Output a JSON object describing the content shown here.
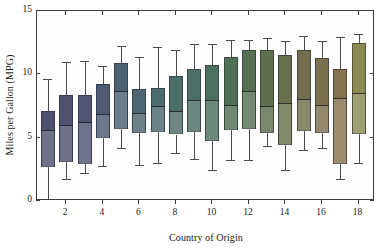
{
  "chart_data": {
    "type": "box",
    "title": "",
    "xlabel": "Country of Origin",
    "ylabel": "Miles per Gallon (MPG)",
    "xlim": [
      0.4,
      18.9
    ],
    "ylim": [
      0,
      15
    ],
    "ytick_values": [
      0,
      5,
      10,
      15
    ],
    "ytick_labels": [
      "0",
      "5",
      "10",
      "15"
    ],
    "xtick_values": [
      2,
      4,
      6,
      8,
      10,
      12,
      14,
      16,
      18
    ],
    "xtick_labels": [
      "2",
      "4",
      "6",
      "8",
      "10",
      "12",
      "14",
      "16",
      "18"
    ],
    "grid": false,
    "legend": "none",
    "frame": "box",
    "categories": [
      1,
      2,
      3,
      4,
      5,
      6,
      7,
      8,
      9,
      10,
      11,
      12,
      13,
      14,
      15,
      16,
      17,
      18
    ],
    "boxes": [
      {
        "x": 1,
        "whisker_low": 0.0,
        "q1": 2.65,
        "median": 5.6,
        "q3": 7.1,
        "whisker_high": 9.65,
        "color": "#4d5270"
      },
      {
        "x": 2,
        "whisker_low": 1.7,
        "q1": 3.1,
        "median": 6.0,
        "q3": 8.4,
        "whisker_high": 11.0,
        "color": "#4f5370"
      },
      {
        "x": 3,
        "whisker_low": 2.2,
        "q1": 2.9,
        "median": 6.25,
        "q3": 8.4,
        "whisker_high": 11.05,
        "color": "#515573"
      },
      {
        "x": 4,
        "whisker_low": 2.8,
        "q1": 5.0,
        "median": 6.9,
        "q3": 9.2,
        "whisker_high": 10.65,
        "color": "#4f5b73"
      },
      {
        "x": 5,
        "whisker_low": 4.2,
        "q1": 5.7,
        "median": 8.7,
        "q3": 10.9,
        "whisker_high": 12.2,
        "color": "#4c6272"
      },
      {
        "x": 6,
        "whisker_low": 2.85,
        "q1": 5.35,
        "median": 6.95,
        "q3": 8.85,
        "whisker_high": 11.35,
        "color": "#4d6672"
      },
      {
        "x": 7,
        "whisker_low": 3.0,
        "q1": 5.45,
        "median": 7.5,
        "q3": 8.95,
        "whisker_high": 12.15,
        "color": "#4c6a70"
      },
      {
        "x": 8,
        "whisker_low": 3.8,
        "q1": 5.25,
        "median": 7.1,
        "q3": 9.9,
        "whisker_high": 11.95,
        "color": "#4c6d6c"
      },
      {
        "x": 9,
        "whisker_low": 3.35,
        "q1": 5.45,
        "median": 8.0,
        "q3": 10.4,
        "whisker_high": 12.4,
        "color": "#4c6e66"
      },
      {
        "x": 10,
        "whisker_low": 2.45,
        "q1": 4.7,
        "median": 8.0,
        "q3": 10.7,
        "whisker_high": 12.4,
        "color": "#4d6f5f"
      },
      {
        "x": 11,
        "whisker_low": 3.2,
        "q1": 5.6,
        "median": 7.6,
        "q3": 11.4,
        "whisker_high": 12.75,
        "color": "#506f57"
      },
      {
        "x": 12,
        "whisker_low": 3.2,
        "q1": 5.65,
        "median": 8.7,
        "q3": 11.95,
        "whisker_high": 12.7,
        "color": "#556f52"
      },
      {
        "x": 13,
        "whisker_low": 4.35,
        "q1": 5.35,
        "median": 7.5,
        "q3": 11.95,
        "whisker_high": 12.85,
        "color": "#5d6f4f"
      },
      {
        "x": 14,
        "whisker_low": 2.45,
        "q1": 4.4,
        "median": 7.75,
        "q3": 11.55,
        "whisker_high": 12.6,
        "color": "#676f4e"
      },
      {
        "x": 15,
        "whisker_low": 4.0,
        "q1": 5.55,
        "median": 8.05,
        "q3": 11.9,
        "whisker_high": 13.0,
        "color": "#726f4e"
      },
      {
        "x": 16,
        "whisker_low": 4.2,
        "q1": 5.4,
        "median": 7.6,
        "q3": 11.3,
        "whisker_high": 12.6,
        "color": "#7c714f"
      },
      {
        "x": 17,
        "whisker_low": 1.75,
        "q1": 2.95,
        "median": 8.1,
        "q3": 10.4,
        "whisker_high": 12.95,
        "color": "#857350"
      },
      {
        "x": 18,
        "whisker_low": 3.0,
        "q1": 5.3,
        "median": 8.5,
        "q3": 12.5,
        "whisker_high": 13.2,
        "color": "#8a8b52"
      }
    ]
  },
  "style": {
    "axis_color": "#3a3a3a",
    "whisker_color": "#4a4a52",
    "background": "#ffffff",
    "plot_background": "#fdfdfd"
  }
}
